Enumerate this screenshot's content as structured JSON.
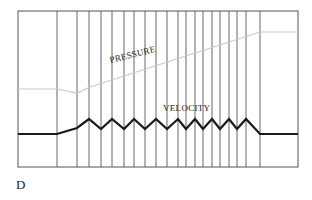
{
  "figure": {
    "panel_letter": "D",
    "labels": {
      "pressure": "PRESSURE",
      "velocity": "VELOCITY"
    },
    "colors": {
      "frame": "#555555",
      "velocity_line": "#1a1a1a",
      "pressure_line": "#c8c8c8",
      "text": "#1a1a1a"
    },
    "frame": {
      "left": 18,
      "top": 11,
      "right": 298,
      "bottom": 167
    },
    "vertical_lines_x": [
      57,
      77,
      89,
      101,
      112,
      124,
      134,
      145,
      156,
      167,
      178,
      186,
      195,
      203,
      212,
      220,
      229,
      237,
      246,
      260
    ],
    "pressure_curve": [
      [
        18,
        89
      ],
      [
        57,
        89
      ],
      [
        77,
        93
      ],
      [
        90,
        87
      ],
      [
        260,
        32
      ],
      [
        298,
        32
      ]
    ],
    "velocity_curve": [
      [
        18,
        134
      ],
      [
        57,
        134
      ],
      [
        77,
        128
      ],
      [
        89,
        119
      ],
      [
        101,
        129
      ],
      [
        112,
        119
      ],
      [
        124,
        129
      ],
      [
        134,
        119
      ],
      [
        145,
        129
      ],
      [
        156,
        119
      ],
      [
        167,
        129
      ],
      [
        178,
        119
      ],
      [
        186,
        129
      ],
      [
        195,
        119
      ],
      [
        203,
        129
      ],
      [
        212,
        119
      ],
      [
        220,
        129
      ],
      [
        229,
        119
      ],
      [
        237,
        129
      ],
      [
        246,
        119
      ],
      [
        260,
        134
      ],
      [
        298,
        134
      ]
    ]
  }
}
